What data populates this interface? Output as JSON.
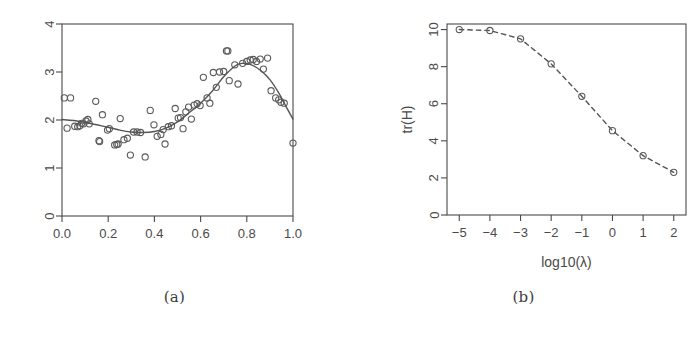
{
  "figure": {
    "background": "#ffffff",
    "ink_color": "#4a4a4a",
    "point_color": "#5a5a5a",
    "curve_color": "#555555"
  },
  "panels": [
    {
      "id": "a",
      "caption": "(a)",
      "chart_data": {
        "type": "scatter",
        "title": "",
        "xlabel": "",
        "ylabel": "",
        "xlim": [
          0,
          1
        ],
        "ylim": [
          0,
          4
        ],
        "grid": false,
        "legend": "none",
        "xticks": [
          "0.0",
          "0.2",
          "0.4",
          "0.6",
          "0.8",
          "1.0"
        ],
        "xtick_values": [
          0.0,
          0.2,
          0.4,
          0.6,
          0.8,
          1.0
        ],
        "yticks": [
          "0",
          "1",
          "2",
          "3",
          "4"
        ],
        "ytick_values": [
          0,
          1,
          2,
          3,
          4
        ],
        "ytick_rotated": true,
        "series": [
          {
            "name": "observations",
            "type": "scatter",
            "marker": "open-circle",
            "x": [
              0.01,
              0.037,
              0.022,
              0.055,
              0.068,
              0.077,
              0.085,
              0.093,
              0.104,
              0.112,
              0.118,
              0.146,
              0.16,
              0.163,
              0.175,
              0.197,
              0.205,
              0.228,
              0.237,
              0.243,
              0.252,
              0.268,
              0.283,
              0.296,
              0.31,
              0.325,
              0.34,
              0.36,
              0.382,
              0.398,
              0.412,
              0.428,
              0.438,
              0.446,
              0.46,
              0.474,
              0.49,
              0.503,
              0.513,
              0.524,
              0.536,
              0.548,
              0.56,
              0.572,
              0.585,
              0.598,
              0.612,
              0.628,
              0.64,
              0.655,
              0.668,
              0.682,
              0.7,
              0.712,
              0.718,
              0.724,
              0.748,
              0.762,
              0.782,
              0.8,
              0.815,
              0.828,
              0.842,
              0.858,
              0.872,
              0.89,
              0.905,
              0.925,
              0.938,
              0.948,
              0.962,
              1.0
            ],
            "y": [
              2.46,
              2.46,
              1.83,
              1.87,
              1.86,
              1.88,
              1.93,
              1.92,
              1.98,
              2.01,
              1.92,
              2.39,
              1.57,
              1.55,
              2.11,
              1.79,
              1.82,
              1.48,
              1.49,
              1.5,
              2.03,
              1.59,
              1.62,
              1.27,
              1.75,
              1.75,
              1.74,
              1.23,
              2.2,
              1.9,
              1.66,
              1.7,
              1.8,
              1.5,
              1.86,
              1.88,
              2.24,
              2.04,
              2.05,
              1.82,
              2.17,
              2.27,
              2.02,
              2.31,
              2.34,
              2.3,
              2.89,
              2.46,
              2.35,
              2.99,
              2.68,
              3.0,
              3.01,
              3.44,
              3.44,
              2.82,
              3.15,
              2.75,
              3.18,
              3.22,
              3.25,
              3.26,
              3.22,
              3.27,
              3.06,
              3.29,
              2.61,
              2.46,
              2.42,
              2.37,
              2.35,
              1.52
            ]
          },
          {
            "name": "smooth-fit",
            "type": "line",
            "style": "solid",
            "x": [
              0.0,
              0.05,
              0.1,
              0.15,
              0.2,
              0.25,
              0.3,
              0.35,
              0.4,
              0.45,
              0.5,
              0.55,
              0.6,
              0.65,
              0.7,
              0.75,
              0.78,
              0.82,
              0.86,
              0.9,
              0.94,
              0.97,
              1.0
            ],
            "y": [
              2.01,
              1.99,
              1.95,
              1.9,
              1.85,
              1.79,
              1.75,
              1.74,
              1.76,
              1.83,
              1.96,
              2.15,
              2.35,
              2.6,
              2.9,
              3.13,
              3.18,
              3.15,
              3.03,
              2.84,
              2.55,
              2.28,
              2.02
            ]
          }
        ]
      }
    },
    {
      "id": "b",
      "caption": "(b)",
      "chart_data": {
        "type": "line",
        "title": "",
        "xlabel": "log10(λ)",
        "ylabel": "tr(H)",
        "xlim": [
          -5.4,
          2.4
        ],
        "ylim": [
          0,
          10.3
        ],
        "grid": false,
        "legend": "none",
        "xticks": [
          "−5",
          "−4",
          "−3",
          "−2",
          "−1",
          "0",
          "1",
          "2"
        ],
        "xtick_values": [
          -5,
          -4,
          -3,
          -2,
          -1,
          0,
          1,
          2
        ],
        "yticks": [
          "0",
          "2",
          "4",
          "6",
          "8",
          "10"
        ],
        "ytick_values": [
          0,
          2,
          4,
          6,
          8,
          10
        ],
        "ytick_rotated": true,
        "series": [
          {
            "name": "tr(H) vs log10(lambda)",
            "type": "line",
            "style": "dashed",
            "marker": "open-circle",
            "x": [
              -5,
              -4,
              -3,
              -2,
              -1,
              0,
              1,
              2
            ],
            "y": [
              10.0,
              9.95,
              9.5,
              8.15,
              6.4,
              4.55,
              3.2,
              2.3
            ]
          }
        ]
      }
    }
  ]
}
